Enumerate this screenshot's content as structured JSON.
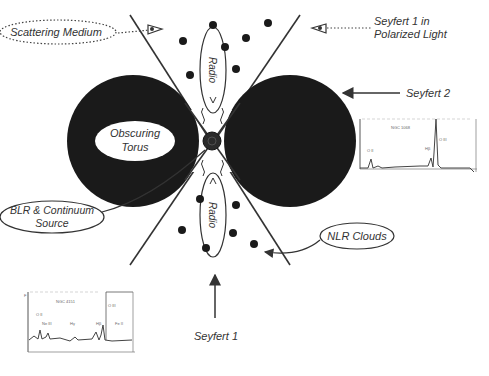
{
  "diagram": {
    "colors": {
      "torus": "#1a1a1a",
      "line": "#333333",
      "text": "#333333",
      "background": "#ffffff"
    },
    "labels": {
      "scattering_medium": "Scattering Medium",
      "seyfert1_polarized_line1": "Seyfert 1 in",
      "seyfert1_polarized_line2": "Polarized Light",
      "seyfert2": "Seyfert 2",
      "obscuring_torus_line1": "Obscuring",
      "obscuring_torus_line2": "Torus",
      "blr_line1": "BLR & Continuum",
      "blr_line2": "Source",
      "nlr_clouds": "NLR Clouds",
      "radio_top": "Radio",
      "radio_bottom": "Radio",
      "seyfert1": "Seyfert 1"
    },
    "icons": {
      "eye_left": "eye-icon",
      "eye_right": "eye-icon",
      "black_hole": "black-hole-icon"
    },
    "spectra": {
      "seyfert2_spectrum": {
        "title": "NGC 1068",
        "lines": [
          "[O III]",
          "Hβ",
          "[O II]"
        ]
      },
      "seyfert1_spectrum": {
        "title": "NGC 4151",
        "lines": [
          "[O III]",
          "Hβ",
          "[Ne III]",
          "Hγ",
          "[O II]",
          "He II",
          "Fe II"
        ]
      }
    }
  }
}
